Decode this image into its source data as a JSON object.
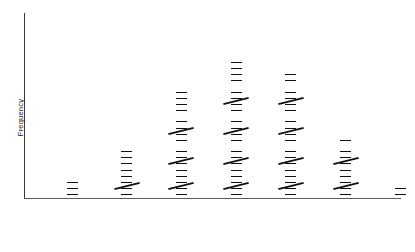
{
  "chart_data": {
    "type": "bar",
    "title": "",
    "subtitle": "",
    "xlabel": "",
    "ylabel": "Frequency",
    "grid": false,
    "legend": "none",
    "notation": "tally-marks",
    "orientation": "vertical-rotated-tally",
    "categories": [
      "50,100",
      "51,200",
      "52,300",
      "53,400",
      "54,500",
      "55,600",
      "56,700"
    ],
    "values": [
      3,
      9,
      19,
      24,
      22,
      11,
      2
    ],
    "tally_groups": [
      {
        "category": "50,100",
        "total": 3,
        "fives": 0,
        "remainder": 3
      },
      {
        "category": "51,200",
        "total": 9,
        "fives": 1,
        "remainder": 4
      },
      {
        "category": "52,300",
        "total": 19,
        "fives": 3,
        "remainder": 4
      },
      {
        "category": "53,400",
        "total": 24,
        "fives": 4,
        "remainder": 4
      },
      {
        "category": "54,500",
        "total": 22,
        "fives": 4,
        "remainder": 2
      },
      {
        "category": "55,600",
        "total": 11,
        "fives": 2,
        "remainder": 1
      },
      {
        "category": "56,700",
        "total": 2,
        "fives": 0,
        "remainder": 2
      }
    ],
    "ylim": [
      0,
      24
    ],
    "xlim_labels": [
      "50,100",
      "56,700"
    ]
  },
  "axes": {
    "y_title": "Frequency",
    "x_tick_labels": [
      "50,100",
      "51,200",
      "52,300",
      "53,400",
      "54,500",
      "55,600",
      "56,700"
    ]
  },
  "colors": {
    "ink": "#111111",
    "axis": "#4a4a4a",
    "background": "#ffffff"
  }
}
